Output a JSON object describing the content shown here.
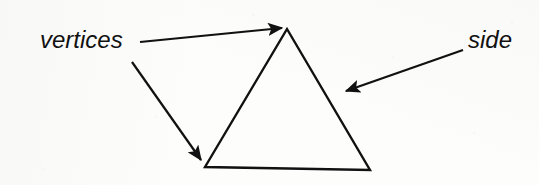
{
  "figure": {
    "kind": "geometry-diagram",
    "background_color": "#fdfdfc",
    "ink_color": "#111111",
    "canvas": {
      "width": 539,
      "height": 185
    }
  },
  "labels": {
    "vertices": {
      "text": "vertices",
      "x": 40,
      "y": 48,
      "font_size": 24,
      "style": "italic"
    },
    "side": {
      "text": "side",
      "x": 468,
      "y": 48,
      "font_size": 24,
      "style": "italic"
    }
  },
  "shape": {
    "name": "triangle",
    "stroke_width": 2.4,
    "fill": "none",
    "points": "287,29 370,170 205,167",
    "vertex_list": [
      {
        "name": "apex",
        "x": 287,
        "y": 29
      },
      {
        "name": "bottom-right",
        "x": 370,
        "y": 170
      },
      {
        "name": "bottom-left",
        "x": 205,
        "y": 167
      }
    ]
  },
  "annotations": [
    {
      "name": "arrow-vertices-to-apex",
      "from_label": "vertices",
      "target": "apex",
      "x1": 140,
      "y1": 42,
      "x2": 284,
      "y2": 28,
      "stroke_width": 2.2
    },
    {
      "name": "arrow-vertices-to-bottom-left",
      "from_label": "vertices",
      "target": "bottom-left",
      "x1": 132,
      "y1": 62,
      "x2": 203,
      "y2": 162,
      "stroke_width": 2.2
    },
    {
      "name": "arrow-side-to-right-edge",
      "from_label": "side",
      "target": "right-side",
      "x1": 463,
      "y1": 50,
      "x2": 344,
      "y2": 92,
      "stroke_width": 2.2
    }
  ]
}
